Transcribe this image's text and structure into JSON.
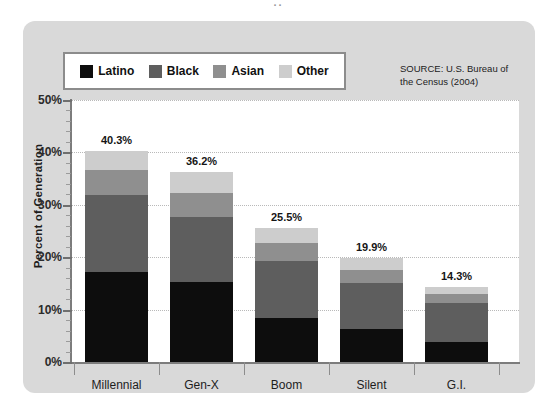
{
  "title_remnant": "..",
  "source_note": "SOURCE: U.S. Bureau of the Census (2004)",
  "source_line1": "SOURCE: U.S. Bureau of",
  "source_line2": "the Census (2004)",
  "legend": {
    "items": [
      {
        "label": "Latino",
        "color": "#0d0d0d"
      },
      {
        "label": "Black",
        "color": "#5e5e5e"
      },
      {
        "label": "Asian",
        "color": "#8f8f8f"
      },
      {
        "label": "Other",
        "color": "#cdcdcd"
      }
    ]
  },
  "axis": {
    "y_title": "Percent of Generation",
    "y_ticks": [
      "0%",
      "10%",
      "20%",
      "30%",
      "40%",
      "50%"
    ],
    "y_min": 0,
    "y_max": 50
  },
  "chart_data": {
    "type": "bar",
    "subtype": "stacked-bar",
    "title": "",
    "xlabel": "",
    "ylabel": "Percent of Generation",
    "ylim": [
      0,
      50
    ],
    "ytick_values": [
      0,
      10,
      20,
      30,
      40,
      50
    ],
    "ytick_labels": [
      "0%",
      "10%",
      "20%",
      "30%",
      "40%",
      "50%"
    ],
    "grid": true,
    "grid_style": "dotted-horizontal",
    "legend_position": "top-left-inside",
    "categories": [
      "Millennial",
      "Gen-X",
      "Boom",
      "Silent",
      "G.I."
    ],
    "series": [
      {
        "name": "Latino",
        "color": "#0d0d0d",
        "values": [
          17.2,
          15.3,
          8.4,
          6.2,
          3.9
        ]
      },
      {
        "name": "Black",
        "color": "#5e5e5e",
        "values": [
          14.7,
          12.4,
          10.9,
          8.8,
          7.4
        ]
      },
      {
        "name": "Asian",
        "color": "#8f8f8f",
        "values": [
          4.8,
          4.5,
          3.4,
          2.5,
          1.7
        ]
      },
      {
        "name": "Other",
        "color": "#cdcdcd",
        "values": [
          3.6,
          4.0,
          2.8,
          2.4,
          1.3
        ]
      }
    ],
    "totals": [
      40.3,
      36.2,
      25.5,
      19.9,
      14.3
    ],
    "total_labels": [
      "40.3%",
      "36.2%",
      "25.5%",
      "19.9%",
      "14.3%"
    ],
    "annotations": [
      "SOURCE: U.S. Bureau of the Census (2004)"
    ]
  }
}
